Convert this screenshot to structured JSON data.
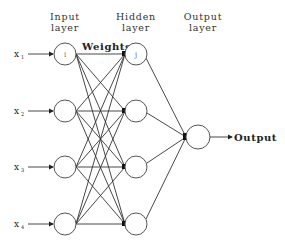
{
  "diagram": {
    "headers": {
      "input": [
        "Input",
        "layer"
      ],
      "hidden": [
        "Hidden",
        "layer"
      ],
      "output": [
        "Output",
        "layer"
      ]
    },
    "weights_label": "Weights",
    "output_label": "Output",
    "inputs": [
      {
        "label": "x",
        "sub": "1"
      },
      {
        "label": "x",
        "sub": "2"
      },
      {
        "label": "x",
        "sub": "3"
      },
      {
        "label": "x",
        "sub": "4"
      }
    ],
    "input_node_marker": "i",
    "hidden_node_marker": "j",
    "layers": {
      "input_count": 4,
      "hidden_count": 4,
      "output_count": 1
    },
    "colors": {
      "line": "#333333",
      "node_stroke": "#555555",
      "background": "#ffffff"
    }
  }
}
